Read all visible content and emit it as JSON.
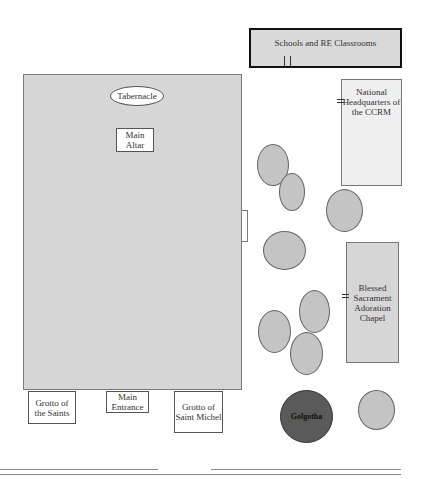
{
  "diagram": {
    "type": "site-plan",
    "buildings": {
      "main_church": {
        "tabernacle": "Tabernacle",
        "main_altar": "Main Altar"
      },
      "schools": "Schools and RE Classrooms",
      "headquarters": "National Headquarters of the CCRM",
      "chapel": "Blessed Sacrament Adoration Chapel"
    },
    "entrances": {
      "grotto_saints": "Grotto of the Saints",
      "main_entrance": "Main Entrance",
      "grotto_michel": "Grotto of Saint Michel"
    },
    "landmarks": {
      "golgotha": "Golgotha"
    },
    "tree_count": 11,
    "colors": {
      "building_fill": "#d6d6d6",
      "tree_fill": "#c4c4c4",
      "golgotha_fill": "#5a5a5a",
      "border": "#555555"
    }
  }
}
